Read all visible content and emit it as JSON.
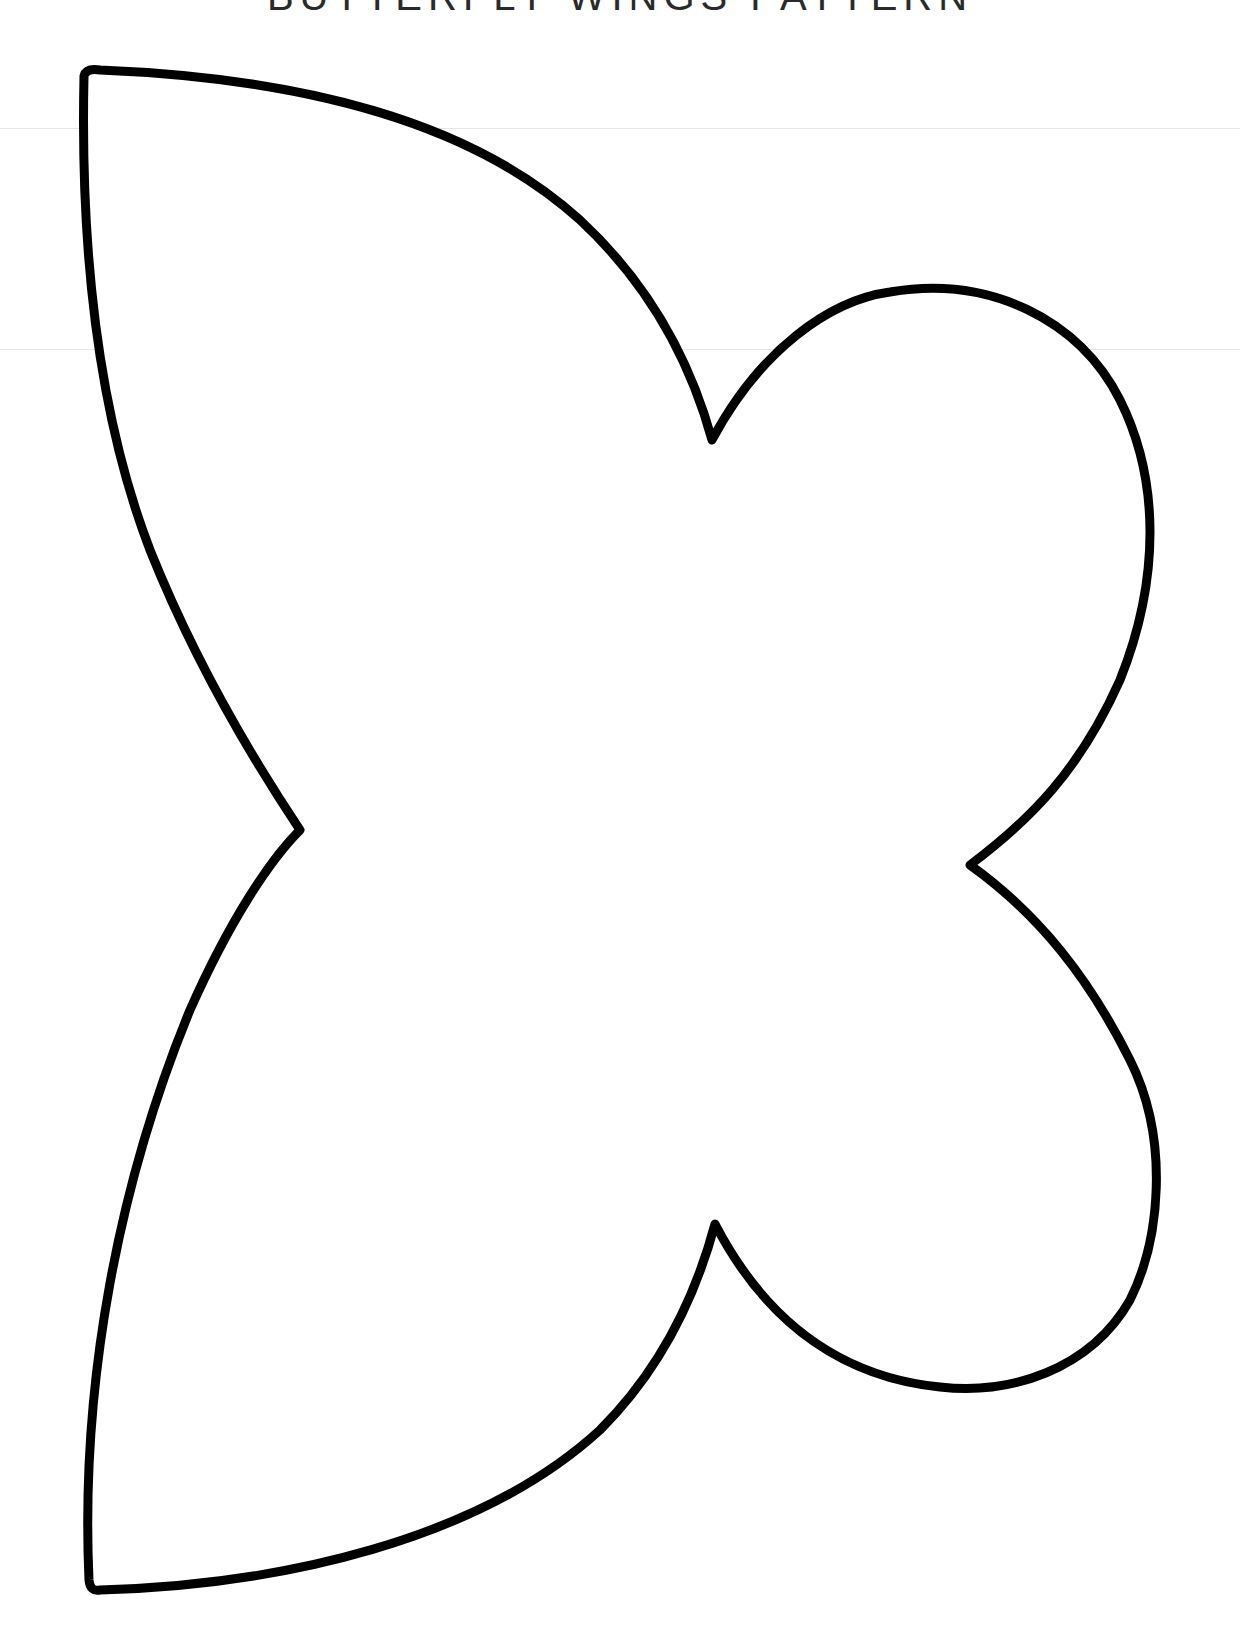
{
  "header": {
    "title": "BUTTERFLY WINGS PATTERN",
    "cropped": true
  },
  "template": {
    "shape": "butterfly-wings-outline",
    "stroke_color": "#000000",
    "fill_color": "#ffffff",
    "stroke_width": 9
  },
  "colors": {
    "background": "#ffffff",
    "outline": "#000000",
    "faint_lines": "#e6e6e6"
  }
}
